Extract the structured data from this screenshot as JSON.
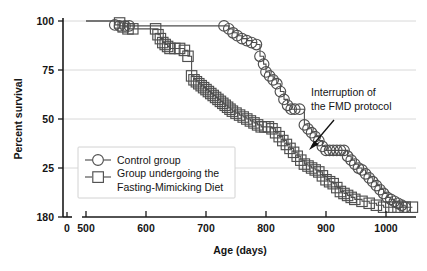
{
  "chart_data": {
    "type": "line",
    "title": "",
    "xlabel": "Age (days)",
    "ylabel": "Percent survival",
    "xlim": [
      500,
      1060
    ],
    "ylim": [
      0,
      100
    ],
    "x_ticks": [
      "0",
      "500",
      "600",
      "700",
      "800",
      "900",
      "1000"
    ],
    "x_tick_values": [
      0,
      500,
      600,
      700,
      800,
      900,
      1000
    ],
    "y_ticks": [
      "100",
      "75",
      "50",
      "25",
      "180"
    ],
    "y_tick_values": [
      100,
      75,
      50,
      25,
      0
    ],
    "grid": "horizontal",
    "axis_break": true,
    "legend_position": "lower-left",
    "marker_color": "#4f4f4f",
    "grid_color": "#d8d8d8",
    "axis_color": "#1a1a1a",
    "series": [
      {
        "name": "Control group",
        "marker": "circle",
        "x": [
          500,
          548,
          556,
          565,
          572,
          730,
          738,
          745,
          752,
          760,
          768,
          776,
          784,
          790,
          796,
          800,
          806,
          812,
          818,
          824,
          830,
          836,
          842,
          848,
          856,
          864,
          870,
          876,
          882,
          888,
          894,
          900,
          906,
          912,
          918,
          924,
          930,
          936,
          942,
          948,
          954,
          960,
          966,
          972,
          978,
          984,
          990,
          996,
          1002,
          1008,
          1014,
          1020,
          1026,
          1032
        ],
        "y": [
          100,
          98,
          97.5,
          97.5,
          97.5,
          97.5,
          96,
          94,
          92.5,
          91,
          90,
          89,
          88,
          82,
          78,
          74,
          72,
          70,
          68,
          64,
          60,
          57,
          55,
          55,
          55,
          47,
          45,
          43,
          41,
          39,
          36,
          34,
          34,
          34,
          34,
          34,
          34,
          31,
          29,
          27,
          25,
          24,
          22,
          20,
          18,
          16,
          14,
          12,
          10,
          9,
          8,
          7,
          6,
          5
        ]
      },
      {
        "name": "Group undergoing the Fasting-Mimicking Diet",
        "marker": "square",
        "x": [
          500,
          556,
          562,
          570,
          578,
          616,
          620,
          624,
          628,
          632,
          636,
          640,
          648,
          656,
          664,
          670,
          676,
          680,
          684,
          688,
          692,
          696,
          700,
          704,
          708,
          712,
          716,
          720,
          724,
          728,
          732,
          736,
          740,
          744,
          750,
          756,
          762,
          768,
          774,
          780,
          786,
          792,
          798,
          804,
          810,
          816,
          822,
          828,
          834,
          840,
          846,
          852,
          858,
          864,
          870,
          876,
          882,
          888,
          894,
          900,
          906,
          912,
          918,
          924,
          930,
          936,
          942,
          948,
          960,
          972,
          984,
          996,
          1008,
          1020,
          1032,
          1044
        ],
        "y": [
          100,
          99,
          97,
          96,
          96,
          96,
          93,
          91,
          89,
          88,
          87,
          86,
          86,
          86,
          85,
          82,
          72,
          70,
          69,
          68,
          67,
          66,
          65,
          64,
          63,
          62,
          61,
          60,
          59,
          58,
          57,
          56,
          55,
          54,
          53,
          52,
          51,
          50,
          49,
          48,
          47,
          46,
          46,
          46,
          45,
          43,
          41,
          39,
          37,
          35,
          33,
          31,
          29,
          27,
          26,
          25,
          24,
          23,
          21,
          19,
          18,
          17,
          15,
          13,
          12,
          11,
          10,
          9,
          8,
          7,
          6,
          5,
          5,
          5,
          5,
          5
        ]
      }
    ],
    "annotations": [
      {
        "text_line_1": "Interruption of",
        "text_line_2": "the FMD protocol",
        "points_to_x": 900,
        "points_to_y": 36
      }
    ]
  },
  "legend": {
    "entry_control_label": "Control group",
    "entry_fmd_label_line_1": "Group undergoing the",
    "entry_fmd_label_line_2": "Fasting-Mimicking Diet"
  },
  "axes": {
    "x_title": "Age (days)",
    "y_title": "Percent survival",
    "x_tick_0": "0",
    "x_tick_500": "500",
    "x_tick_600": "600",
    "x_tick_700": "700",
    "x_tick_800": "800",
    "x_tick_900": "900",
    "x_tick_1000": "1000",
    "y_tick_100": "100",
    "y_tick_75": "75",
    "y_tick_50": "50",
    "y_tick_25": "25",
    "y_tick_0": "180"
  },
  "annotation": {
    "line_1": "Interruption of",
    "line_2": "the FMD protocol"
  }
}
